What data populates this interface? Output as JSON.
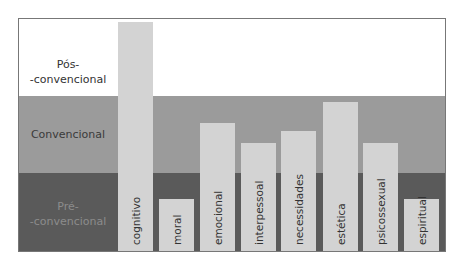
{
  "chart_data": {
    "type": "bar",
    "title": "",
    "xlabel": "",
    "ylabel": "",
    "categories": [
      "cognitivo",
      "moral",
      "emocional",
      "interpessoal",
      "necessidades",
      "estética",
      "psicossexual",
      "espiritual"
    ],
    "values": [
      2.93,
      0.65,
      1.63,
      1.36,
      1.52,
      1.89,
      1.36,
      0.65
    ],
    "bands": [
      {
        "name": "Pré-convencional",
        "label_line1": "Pré-",
        "label_line2": "-convencional",
        "range": [
          0,
          1
        ],
        "color": "#5a5a5a"
      },
      {
        "name": "Convencional",
        "label_line1": "Convencional",
        "range": [
          1,
          2
        ],
        "color": "#9b9b9b"
      },
      {
        "name": "Pós-convencional",
        "label_line1": "Pós-",
        "label_line2": "-convencional",
        "range": [
          2,
          3
        ],
        "color": "#ffffff"
      }
    ],
    "ylim": [
      0,
      3
    ],
    "grid": false,
    "legend": "none",
    "bar_color": "#d3d3d3"
  },
  "labels": {
    "post_1": "Pós-",
    "post_2": "-convencional",
    "conv": "Convencional",
    "pre_1": "Pré-",
    "pre_2": "-convencional"
  }
}
